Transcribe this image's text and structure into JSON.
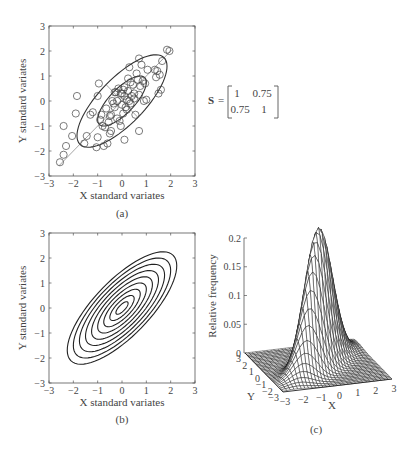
{
  "chart_data": [
    {
      "id": "a",
      "type": "scatter",
      "caption": "(a)",
      "xlabel": "X standard variates",
      "ylabel": "Y standard variates",
      "xlim": [
        -3,
        3
      ],
      "ylim": [
        -3,
        3
      ],
      "xticks": [
        "-3",
        "-2",
        "-1",
        "0",
        "1",
        "2",
        "3"
      ],
      "yticks": [
        "-3",
        "-2",
        "-1",
        "0",
        "1",
        "2",
        "3"
      ],
      "grid": false,
      "annotations": [
        "inner 1-sigma ellipse",
        "outer 2-sigma ellipse",
        "major axis line",
        "minor axis line"
      ],
      "points": [
        [
          -2.55,
          -2.45
        ],
        [
          -2.4,
          -2.15
        ],
        [
          -2.3,
          -1.8
        ],
        [
          -2.4,
          -1.0
        ],
        [
          -2.05,
          -1.4
        ],
        [
          -1.9,
          -0.5
        ],
        [
          -1.85,
          0.2
        ],
        [
          -1.55,
          -1.7
        ],
        [
          -1.45,
          -1.4
        ],
        [
          -1.3,
          -0.55
        ],
        [
          -1.2,
          -0.45
        ],
        [
          -1.05,
          -1.85
        ],
        [
          -1.0,
          -1.45
        ],
        [
          -1.0,
          0.2
        ],
        [
          -0.95,
          0.7
        ],
        [
          -0.9,
          -0.75
        ],
        [
          -0.85,
          -0.55
        ],
        [
          -0.8,
          -1.0
        ],
        [
          -0.75,
          -1.8
        ],
        [
          -0.7,
          -1.05
        ],
        [
          -0.65,
          -0.3
        ],
        [
          -0.6,
          -1.7
        ],
        [
          -0.55,
          -0.85
        ],
        [
          -0.5,
          -1.3
        ],
        [
          -0.45,
          -0.55
        ],
        [
          -0.45,
          -1.2
        ],
        [
          -0.4,
          0.0
        ],
        [
          -0.35,
          -0.1
        ],
        [
          -0.3,
          -0.25
        ],
        [
          -0.25,
          0.35
        ],
        [
          -0.2,
          -0.7
        ],
        [
          -0.2,
          0.0
        ],
        [
          -0.15,
          0.5
        ],
        [
          -0.1,
          -0.8
        ],
        [
          -0.05,
          -1.0
        ],
        [
          0.0,
          0.3
        ],
        [
          0.0,
          -0.15
        ],
        [
          0.05,
          0.45
        ],
        [
          0.05,
          -0.5
        ],
        [
          0.1,
          0.2
        ],
        [
          0.1,
          0.55
        ],
        [
          0.15,
          -0.25
        ],
        [
          0.2,
          0.05
        ],
        [
          0.2,
          -0.35
        ],
        [
          0.25,
          0.4
        ],
        [
          0.25,
          0.9
        ],
        [
          0.3,
          0.0
        ],
        [
          0.3,
          1.35
        ],
        [
          0.35,
          -0.1
        ],
        [
          0.35,
          0.75
        ],
        [
          0.4,
          0.2
        ],
        [
          0.45,
          0.65
        ],
        [
          0.5,
          0.3
        ],
        [
          0.55,
          -0.55
        ],
        [
          0.6,
          1.1
        ],
        [
          0.65,
          0.85
        ],
        [
          0.7,
          0.25
        ],
        [
          0.7,
          -1.2
        ],
        [
          0.75,
          0.6
        ],
        [
          0.8,
          1.45
        ],
        [
          0.85,
          0.8
        ],
        [
          0.9,
          0.0
        ],
        [
          0.95,
          0.7
        ],
        [
          1.0,
          0.05
        ],
        [
          1.05,
          1.25
        ],
        [
          1.35,
          1.25
        ],
        [
          1.4,
          0.95
        ],
        [
          1.45,
          1.2
        ],
        [
          1.5,
          0.3
        ],
        [
          1.55,
          1.05
        ],
        [
          1.6,
          0.45
        ],
        [
          1.65,
          1.6
        ],
        [
          1.85,
          2.05
        ],
        [
          1.95,
          2.0
        ],
        [
          -0.05,
          0.3
        ],
        [
          0.1,
          -1.55
        ],
        [
          -0.5,
          -0.6
        ],
        [
          -0.3,
          0.35
        ],
        [
          0.5,
          0.1
        ],
        [
          0.7,
          1.7
        ]
      ]
    },
    {
      "id": "b",
      "type": "contour",
      "caption": "(b)",
      "xlabel": "X standard variates",
      "ylabel": "Y standard variates",
      "xlim": [
        -3,
        3
      ],
      "ylim": [
        -3,
        3
      ],
      "xticks": [
        "-3",
        "-2",
        "-1",
        "0",
        "1",
        "2",
        "3"
      ],
      "yticks": [
        "-3",
        "-2",
        "-1",
        "0",
        "1",
        "2",
        "3"
      ],
      "grid": false,
      "correlation": 0.75,
      "contour_levels_sigma": [
        0.25,
        0.5,
        0.75,
        1.0,
        1.25,
        1.5,
        1.75,
        2.0,
        2.25
      ]
    },
    {
      "id": "c",
      "type": "surface",
      "caption": "(c)",
      "xlabel": "X",
      "ylabel": "Y",
      "zlabel": "Relative frequency",
      "xlim": [
        -3,
        3
      ],
      "ylim": [
        -3,
        3
      ],
      "zlim": [
        0,
        0.2
      ],
      "xticks": [
        "-3",
        "-2",
        "-1",
        "0",
        "1",
        "2",
        "3"
      ],
      "yticks": [
        "3",
        "2",
        "1",
        "0",
        "-1",
        "-2",
        "-3"
      ],
      "zticks": [
        "0",
        "0.05",
        "0.1",
        "0.15",
        "0.2"
      ],
      "peak_value": 0.227,
      "correlation": 0.75
    }
  ],
  "matrix": {
    "symbol": "S",
    "equals": "=",
    "row1": [
      "1",
      "0.75"
    ],
    "row2": [
      "0.75",
      "1"
    ]
  }
}
